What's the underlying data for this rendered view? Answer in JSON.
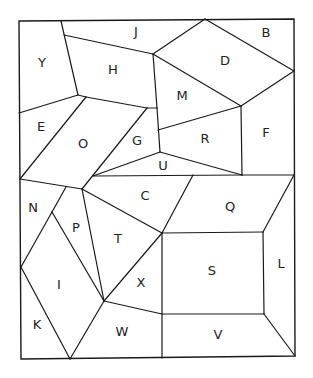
{
  "diagram": {
    "type": "map-puzzle",
    "stroke_color": "#1a1a1a",
    "background": "#ffffff",
    "frame": [
      [
        19,
        21
      ],
      [
        294,
        19
      ],
      [
        295,
        356
      ],
      [
        21,
        359
      ]
    ],
    "vertices": {
      "a1": [
        61,
        21
      ],
      "a2": [
        64,
        35
      ],
      "a3": [
        153,
        54
      ],
      "a4": [
        205,
        19
      ],
      "a5": [
        294,
        71
      ],
      "a6": [
        241,
        106
      ],
      "a7": [
        78,
        95
      ],
      "a8": [
        86,
        97
      ],
      "a9": [
        157,
        108
      ],
      "a10": [
        147,
        108
      ],
      "a11": [
        19,
        113
      ],
      "a12": [
        158,
        130
      ],
      "a13": [
        160,
        152
      ],
      "a14": [
        242,
        175
      ],
      "a15": [
        93,
        176
      ],
      "a16": [
        20,
        179
      ],
      "a17": [
        82,
        189
      ],
      "a18": [
        193,
        175
      ],
      "a19": [
        294,
        175
      ],
      "a20": [
        66,
        187
      ],
      "a21": [
        52,
        212
      ],
      "a22": [
        162,
        233
      ],
      "a23": [
        263,
        232
      ],
      "a24": [
        21,
        267
      ],
      "a25": [
        104,
        301
      ],
      "a26": [
        162,
        314
      ],
      "a27": [
        264,
        314
      ],
      "a28": [
        70,
        359
      ],
      "a29": [
        162,
        358
      ],
      "a30": [
        295,
        356
      ]
    },
    "edges": [
      [
        "a1",
        "a7"
      ],
      [
        "a2",
        "a3"
      ],
      [
        "a3",
        "a4"
      ],
      [
        "a4",
        "a5"
      ],
      [
        "a3",
        "a6"
      ],
      [
        "a5",
        "a6"
      ],
      [
        "a3",
        "a9"
      ],
      [
        "a7",
        "a11"
      ],
      [
        "a7",
        "a8"
      ],
      [
        "a8",
        "a10"
      ],
      [
        "a10",
        "a9"
      ],
      [
        "a8",
        "a16"
      ],
      [
        "a10",
        "a17"
      ],
      [
        "a12",
        "a6"
      ],
      [
        "a9",
        "a13"
      ],
      [
        "a6",
        "a14"
      ],
      [
        "a13",
        "a15"
      ],
      [
        "a13",
        "a14"
      ],
      [
        "a15",
        "a14"
      ],
      [
        "a16",
        "a17"
      ],
      [
        "a18",
        "a22"
      ],
      [
        "a14",
        "a19"
      ],
      [
        "a19",
        "a23"
      ],
      [
        "a20",
        "a21"
      ],
      [
        "a21",
        "a24"
      ],
      [
        "a21",
        "a25"
      ],
      [
        "a17",
        "a25"
      ],
      [
        "a17",
        "a22"
      ],
      [
        "a22",
        "a23"
      ],
      [
        "a22",
        "a25"
      ],
      [
        "a24",
        "a28"
      ],
      [
        "a25",
        "a28"
      ],
      [
        "a25",
        "a26"
      ],
      [
        "a22",
        "a29"
      ],
      [
        "a23",
        "a27"
      ],
      [
        "a26",
        "a27"
      ],
      [
        "a27",
        "a30"
      ]
    ],
    "regions": [
      {
        "label": "Y",
        "x": 42,
        "y": 63
      },
      {
        "label": "J",
        "x": 136,
        "y": 32
      },
      {
        "label": "B",
        "x": 266,
        "y": 33
      },
      {
        "label": "H",
        "x": 113,
        "y": 70
      },
      {
        "label": "D",
        "x": 225,
        "y": 61
      },
      {
        "label": "M",
        "x": 182,
        "y": 96
      },
      {
        "label": "E",
        "x": 41,
        "y": 127
      },
      {
        "label": "O",
        "x": 83,
        "y": 144
      },
      {
        "label": "G",
        "x": 137,
        "y": 141
      },
      {
        "label": "R",
        "x": 205,
        "y": 139
      },
      {
        "label": "F",
        "x": 266,
        "y": 133
      },
      {
        "label": "U",
        "x": 163,
        "y": 166
      },
      {
        "label": "C",
        "x": 145,
        "y": 196
      },
      {
        "label": "N",
        "x": 33,
        "y": 208
      },
      {
        "label": "Q",
        "x": 230,
        "y": 207
      },
      {
        "label": "P",
        "x": 76,
        "y": 228
      },
      {
        "label": "T",
        "x": 118,
        "y": 239
      },
      {
        "label": "S",
        "x": 212,
        "y": 271
      },
      {
        "label": "L",
        "x": 281,
        "y": 264
      },
      {
        "label": "I",
        "x": 59,
        "y": 285
      },
      {
        "label": "X",
        "x": 141,
        "y": 283
      },
      {
        "label": "K",
        "x": 37,
        "y": 325
      },
      {
        "label": "W",
        "x": 122,
        "y": 332
      },
      {
        "label": "V",
        "x": 218,
        "y": 335
      }
    ]
  }
}
